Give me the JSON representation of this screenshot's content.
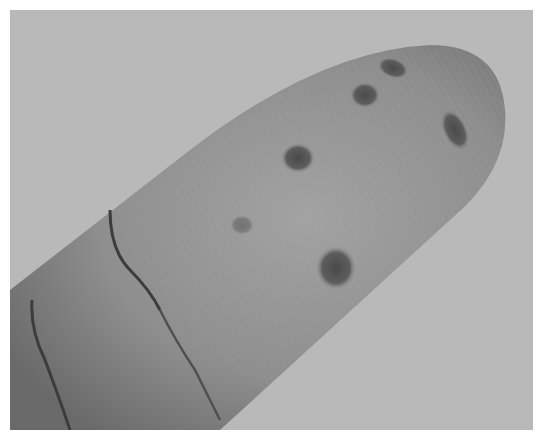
{
  "image": {
    "subject": "fingertip with dark spots",
    "color_mode": "grayscale",
    "colors": {
      "background": "#b9b9b9",
      "skin": "#8f8f8f",
      "skin_highlight": "#a3a3a3",
      "skin_shadow": "#5e5e5e",
      "spot": "#4a4a4a",
      "crease": "#3c3c3c"
    },
    "spots_count": 6
  }
}
